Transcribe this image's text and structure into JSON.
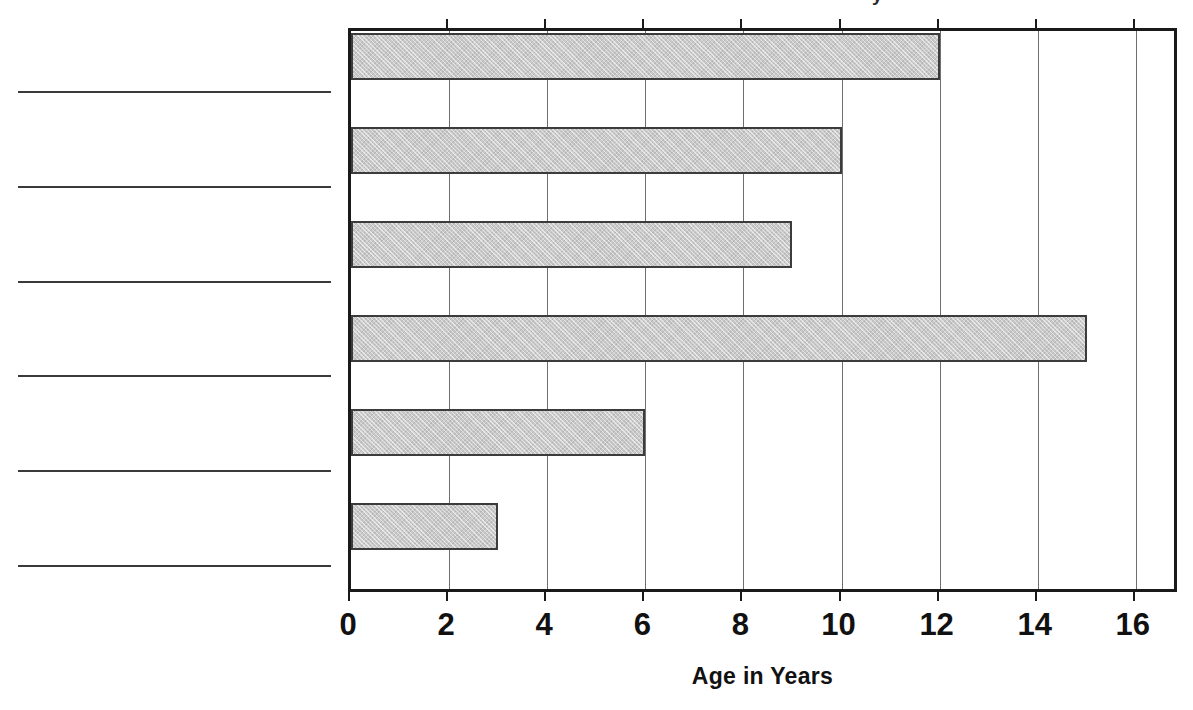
{
  "figure": {
    "top_fragment_text": "y",
    "background_color": "#ffffff"
  },
  "answer_lines": {
    "count": 6,
    "label": "blank category label line",
    "color": "#3a3a3a",
    "items": [
      {
        "id": "answer-line-1",
        "value": ""
      },
      {
        "id": "answer-line-2",
        "value": ""
      },
      {
        "id": "answer-line-3",
        "value": ""
      },
      {
        "id": "answer-line-4",
        "value": ""
      },
      {
        "id": "answer-line-5",
        "value": ""
      },
      {
        "id": "answer-line-6",
        "value": ""
      }
    ]
  },
  "axis": {
    "tick_labels": [
      "0",
      "2",
      "4",
      "6",
      "8",
      "10",
      "12",
      "14",
      "16"
    ],
    "title": "Age in Years"
  },
  "chart_data": {
    "type": "bar",
    "orientation": "horizontal",
    "title": "",
    "subtitle": "",
    "xlabel": "Age in Years",
    "ylabel": "",
    "categories": [
      "",
      "",
      "",
      "",
      "",
      ""
    ],
    "values": [
      12,
      10,
      9,
      15,
      6,
      3
    ],
    "xlim": [
      0,
      16.9
    ],
    "xticks": [
      0,
      2,
      4,
      6,
      8,
      10,
      12,
      14,
      16
    ],
    "grid": "vertical-only",
    "legend": "none",
    "bar_fill_color": "#c9c9c9",
    "bar_edge_color": "#3c3c3c",
    "gridline_color": "#6f6f6f",
    "frame_color": "#1a1a1a",
    "annotations": []
  }
}
